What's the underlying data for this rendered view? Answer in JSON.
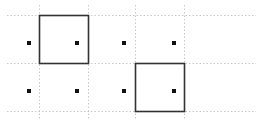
{
  "canvas": {
    "width": 257,
    "height": 120,
    "background": "#ffffff"
  },
  "colors": {
    "grid": "#c8c8c8",
    "box": "#333333",
    "dot": "#111111"
  },
  "grid": {
    "horizontal_lines_y": [
      15,
      63,
      111
    ],
    "horizontal_x_range": [
      7,
      256
    ],
    "vertical_lines_x": [
      39,
      88,
      135,
      184
    ],
    "vertical_y_range": [
      5,
      120
    ]
  },
  "boxes": [
    {
      "id": "box-1",
      "x": 39,
      "y": 15,
      "width": 49,
      "height": 48
    },
    {
      "id": "box-2",
      "x": 135,
      "y": 63,
      "width": 49,
      "height": 48
    }
  ],
  "dots": [
    {
      "x": 29,
      "y": 43
    },
    {
      "x": 77,
      "y": 43
    },
    {
      "x": 124,
      "y": 43
    },
    {
      "x": 174,
      "y": 43
    },
    {
      "x": 29,
      "y": 91
    },
    {
      "x": 77,
      "y": 91
    },
    {
      "x": 124,
      "y": 91
    },
    {
      "x": 174,
      "y": 91
    }
  ]
}
